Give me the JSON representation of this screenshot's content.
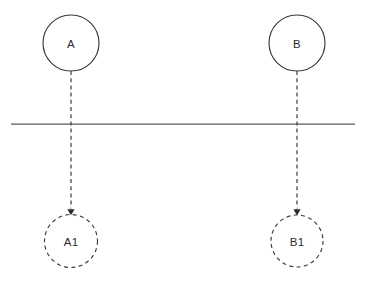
{
  "diagram": {
    "canvas": {
      "width": 366,
      "height": 285,
      "background": "#ffffff"
    },
    "colors": {
      "node_stroke": "#3a3a3a",
      "node_fill": "#ffffff",
      "label_text": "#2b2b2b",
      "divider_stroke": "#5a5a5a",
      "edge_stroke": "#3a3a3a",
      "arrow_fill": "#2b2b2b"
    },
    "nodes": [
      {
        "id": "A",
        "label": "A",
        "shape": "circle",
        "style": "solid",
        "cx": 71,
        "cy": 43,
        "r": 28
      },
      {
        "id": "B",
        "label": "B",
        "shape": "circle",
        "style": "solid",
        "cx": 297,
        "cy": 43,
        "r": 28
      },
      {
        "id": "A1",
        "label": "A1",
        "shape": "circle",
        "style": "dashed",
        "cx": 71,
        "cy": 241,
        "r": 26.5
      },
      {
        "id": "B1",
        "label": "B1",
        "shape": "circle",
        "style": "dashed",
        "cx": 297,
        "cy": 241,
        "r": 26
      }
    ],
    "edges": [
      {
        "id": "edge-a-a1",
        "from": "A",
        "to": "A1",
        "style": "dashed",
        "arrow": "end",
        "x": 71,
        "y_start": 71,
        "y_end": 208.5
      },
      {
        "id": "edge-b-b1",
        "from": "B",
        "to": "B1",
        "style": "dashed",
        "arrow": "end",
        "x": 297,
        "y_start": 71,
        "y_end": 208.5
      }
    ],
    "divider": {
      "id": "divider-line",
      "style": "solid",
      "x_start": 11,
      "x_end": 355,
      "y": 124
    },
    "arrowheads": [
      {
        "id": "arrow-a1",
        "x": 71,
        "tip_y": 215.5,
        "half_width": 3.6,
        "height": 6.2
      },
      {
        "id": "arrow-b1",
        "x": 297,
        "tip_y": 215.5,
        "half_width": 3.6,
        "height": 6.2
      }
    ]
  }
}
